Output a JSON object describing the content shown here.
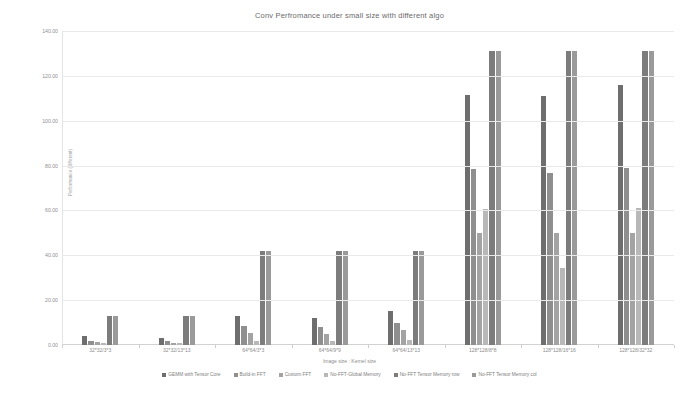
{
  "chart_data": {
    "type": "bar",
    "title": "Conv Perfromance under small size with different algo",
    "xlabel": "Image size : Kernel size",
    "ylabel": "Performance (different)",
    "ylim": [
      0,
      140
    ],
    "ytick_values": [
      0,
      20,
      40,
      60,
      80,
      100,
      120,
      140
    ],
    "ytick_labels": [
      "0.00",
      "20.00",
      "40.00",
      "60.00",
      "80.00",
      "100.00",
      "120.00",
      "140.00"
    ],
    "grid": true,
    "legend_position": "bottom",
    "categories": [
      "32*32/3*3",
      "32*32/13*13",
      "64*64/3*3",
      "64*64/9*9",
      "64*64/13*13",
      "128*128/8*8",
      "128*128/16*16",
      "128*128/32*32"
    ],
    "series": [
      {
        "name": "GEMM with Tensor Core",
        "color": "#6e6e6e",
        "values": [
          4.0,
          3.2,
          13.0,
          12.0,
          15.0,
          111.5,
          111.0,
          116.0
        ]
      },
      {
        "name": "Build-in FFT",
        "color": "#8f8f8f",
        "values": [
          2.0,
          1.6,
          8.5,
          8.0,
          10.0,
          78.5,
          76.5,
          79.0
        ]
      },
      {
        "name": "Custom FFT",
        "color": "#a3a3a3",
        "values": [
          1.2,
          1.0,
          5.5,
          5.0,
          6.5,
          50.0,
          50.0,
          50.0
        ]
      },
      {
        "name": "No-FFT-Global Memory",
        "color": "#b8b8b8",
        "values": [
          0.8,
          0.7,
          2.0,
          1.8,
          2.2,
          60.5,
          34.5,
          61.0
        ]
      },
      {
        "name": "No-FFT Tensor Memory row",
        "color": "#7c7c7c",
        "values": [
          13.0,
          12.8,
          42.0,
          42.0,
          42.0,
          131.0,
          131.0,
          131.0
        ]
      },
      {
        "name": "No-FFT Tensor Memory col",
        "color": "#9a9a9a",
        "values": [
          13.0,
          12.8,
          42.0,
          42.0,
          42.0,
          131.0,
          131.0,
          131.0
        ]
      }
    ]
  },
  "meta": {
    "background_color": "#ffffff",
    "grid_color": "#e9e9e9",
    "text_color": "#8a8a8a"
  }
}
